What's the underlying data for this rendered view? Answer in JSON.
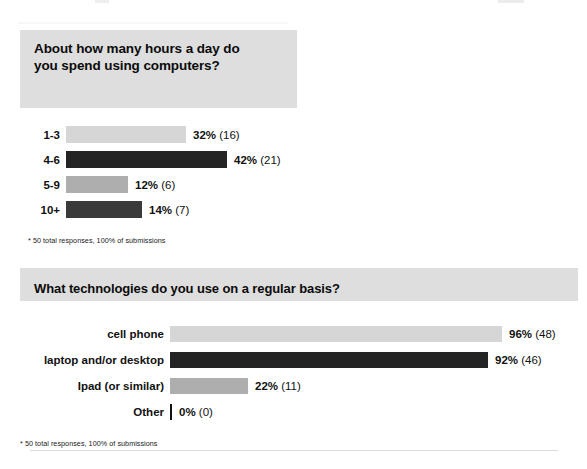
{
  "page": {
    "divider_present": true
  },
  "charts": [
    {
      "title": "About how many hours a day do you spend using computers?",
      "footnote": "* 50 total responses, 100% of submissions",
      "rows": [
        {
          "label": "1-3",
          "pct_label": "32%",
          "count_label": "(16)",
          "width_px": 120,
          "tone": "tone-light"
        },
        {
          "label": "4-6",
          "pct_label": "42%",
          "count_label": "(21)",
          "width_px": 161,
          "tone": "tone-dark"
        },
        {
          "label": "5-9",
          "pct_label": "12%",
          "count_label": "(6)",
          "width_px": 62,
          "tone": "tone-mid"
        },
        {
          "label": "10+",
          "pct_label": "14%",
          "count_label": "(7)",
          "width_px": 76,
          "tone": "tone-dark2"
        }
      ]
    },
    {
      "title": "What technologies do you use on a regular basis?",
      "footnote": "* 50 total responses, 100% of submissions",
      "rows": [
        {
          "label": "cell phone",
          "pct_label": "96%",
          "count_label": "(48)",
          "width_px": 332,
          "tone": "tone-light"
        },
        {
          "label": "laptop and/or desktop",
          "pct_label": "92%",
          "count_label": "(46)",
          "width_px": 318,
          "tone": "tone-dark"
        },
        {
          "label": "Ipad (or similar)",
          "pct_label": "22%",
          "count_label": "(11)",
          "width_px": 78,
          "tone": "tone-mid"
        },
        {
          "label": "Other",
          "pct_label": "0%",
          "count_label": "(0)",
          "width_px": 2,
          "tone": "tone-zero"
        }
      ]
    }
  ],
  "chart_data": [
    {
      "type": "bar",
      "orientation": "horizontal",
      "title": "About how many hours a day do you spend using computers?",
      "xlabel": "",
      "ylabel": "",
      "categories": [
        "1-3",
        "4-6",
        "5-9",
        "10+"
      ],
      "values": [
        32,
        42,
        12,
        14
      ],
      "counts": [
        16,
        21,
        6,
        7
      ],
      "value_unit": "percent",
      "data_labels": [
        "32% (16)",
        "42% (21)",
        "12% (6)",
        "14% (7)"
      ],
      "xlim": [
        0,
        100
      ],
      "grid": false,
      "legend": "none",
      "annotation": "* 50 total responses, 100% of submissions",
      "total_responses": 50,
      "bar_colors": [
        "#d6d6d6",
        "#242424",
        "#aeaeae",
        "#3a3a3a"
      ]
    },
    {
      "type": "bar",
      "orientation": "horizontal",
      "title": "What technologies do you use on a regular basis?",
      "xlabel": "",
      "ylabel": "",
      "categories": [
        "cell phone",
        "laptop and/or desktop",
        "Ipad (or similar)",
        "Other"
      ],
      "values": [
        96,
        92,
        22,
        0
      ],
      "counts": [
        48,
        46,
        11,
        0
      ],
      "value_unit": "percent",
      "data_labels": [
        "96% (48)",
        "92% (46)",
        "22% (11)",
        "0% (0)"
      ],
      "xlim": [
        0,
        100
      ],
      "grid": false,
      "legend": "none",
      "annotation": "* 50 total responses, 100% of submissions",
      "total_responses": 50,
      "bar_colors": [
        "#d6d6d6",
        "#242424",
        "#aeaeae",
        "#111111"
      ]
    }
  ]
}
